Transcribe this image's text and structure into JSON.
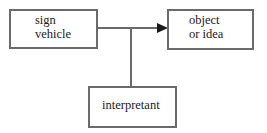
{
  "diagram": {
    "type": "semiotic-triad",
    "nodes": [
      {
        "id": "sign_vehicle",
        "line1": "sign",
        "line2": "vehicle"
      },
      {
        "id": "object",
        "line1": "object",
        "line2": "or idea"
      },
      {
        "id": "interpretant",
        "line1": "interpretant"
      }
    ],
    "edges": [
      {
        "from": "sign_vehicle",
        "to": "object",
        "arrow": "end"
      },
      {
        "from": "interpretant",
        "to": "sign_vehicle-object-edge",
        "arrow": "none"
      }
    ],
    "colors": {
      "stroke": "#6a6a6a",
      "arrow": "#1a1a1a",
      "text": "#1a1a1a",
      "background": "#ffffff"
    }
  }
}
